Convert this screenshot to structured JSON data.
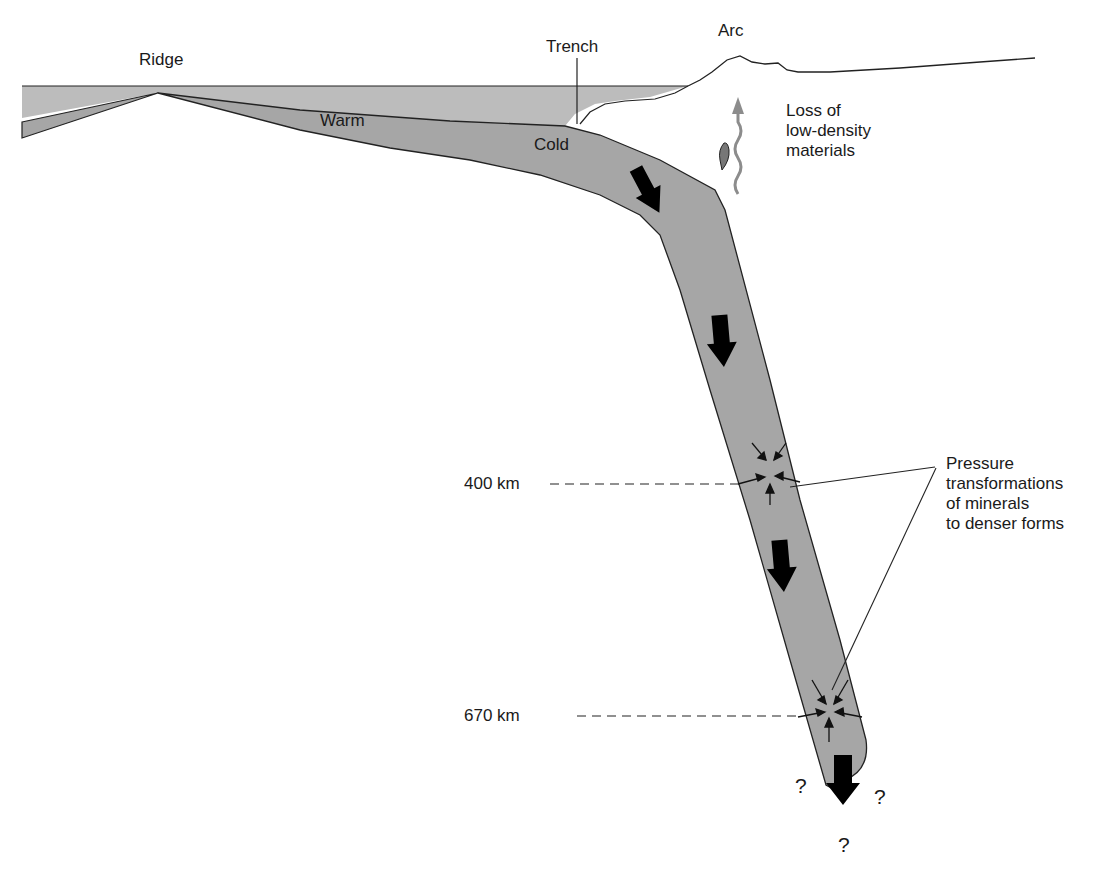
{
  "diagram": {
    "type": "subduction-zone cross-section",
    "labels": {
      "ridge": "Ridge",
      "trench": "Trench",
      "arc": "Arc",
      "warm": "Warm",
      "cold": "Cold",
      "depth_400": "400 km",
      "depth_670": "670 km"
    },
    "loss_note": [
      "Loss of",
      "low-density",
      "materials"
    ],
    "pressure_note": [
      "Pressure",
      "transformations",
      "of minerals",
      "to denser forms"
    ],
    "unknown_marks": [
      "?",
      "?",
      "?"
    ],
    "colors": {
      "ocean": "#b8b8b8",
      "slab": "#a6a6a6",
      "arrow": "#000000",
      "loss_arrow": "#8c8c8c",
      "outline": "#222222"
    }
  }
}
